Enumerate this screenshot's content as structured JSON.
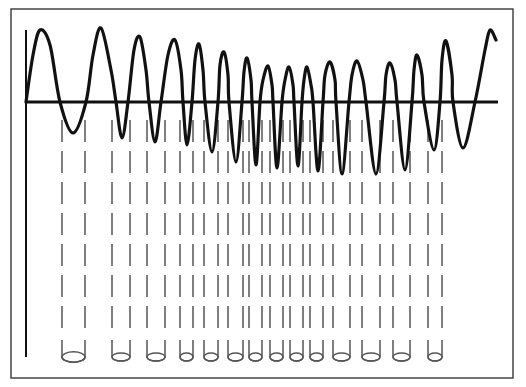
{
  "diagram": {
    "colors": {
      "stroke": "#111111",
      "dash": "#555555",
      "frame": "#444444",
      "background": "#ffffff"
    },
    "frame": {
      "x": 11,
      "y": 9,
      "w": 502,
      "h": 369
    },
    "y_axis": {
      "x": 26,
      "y1": 30,
      "y2": 357
    },
    "x_axis": {
      "y": 102,
      "x1": 26,
      "x2": 498
    },
    "wave_points": [
      [
        26,
        102
      ],
      [
        33,
        55
      ],
      [
        40,
        30
      ],
      [
        50,
        45
      ],
      [
        60,
        102
      ],
      [
        73,
        133
      ],
      [
        86,
        102
      ],
      [
        93,
        55
      ],
      [
        101,
        28
      ],
      [
        111,
        70
      ],
      [
        116,
        102
      ],
      [
        122,
        138
      ],
      [
        128,
        102
      ],
      [
        134,
        50
      ],
      [
        140,
        37
      ],
      [
        146,
        70
      ],
      [
        149,
        102
      ],
      [
        155,
        142
      ],
      [
        161,
        102
      ],
      [
        168,
        55
      ],
      [
        175,
        40
      ],
      [
        181,
        70
      ],
      [
        183,
        102
      ],
      [
        187,
        145
      ],
      [
        192,
        102
      ],
      [
        195,
        60
      ],
      [
        199,
        44
      ],
      [
        203,
        70
      ],
      [
        205,
        102
      ],
      [
        212,
        152
      ],
      [
        218,
        102
      ],
      [
        220,
        65
      ],
      [
        224,
        52
      ],
      [
        228,
        75
      ],
      [
        229,
        102
      ],
      [
        236,
        162
      ],
      [
        242,
        102
      ],
      [
        244,
        72
      ],
      [
        247,
        58
      ],
      [
        251,
        80
      ],
      [
        252,
        102
      ],
      [
        256,
        165
      ],
      [
        260,
        102
      ],
      [
        263,
        80
      ],
      [
        268,
        66
      ],
      [
        272,
        85
      ],
      [
        273,
        102
      ],
      [
        277,
        168
      ],
      [
        282,
        102
      ],
      [
        285,
        80
      ],
      [
        289,
        67
      ],
      [
        293,
        85
      ],
      [
        294,
        102
      ],
      [
        298,
        166
      ],
      [
        302,
        102
      ],
      [
        304,
        80
      ],
      [
        307,
        67
      ],
      [
        311,
        85
      ],
      [
        313,
        102
      ],
      [
        318,
        171
      ],
      [
        323,
        102
      ],
      [
        325,
        75
      ],
      [
        330,
        62
      ],
      [
        335,
        80
      ],
      [
        336,
        102
      ],
      [
        342,
        174
      ],
      [
        349,
        102
      ],
      [
        352,
        75
      ],
      [
        357,
        61
      ],
      [
        363,
        80
      ],
      [
        366,
        102
      ],
      [
        376,
        174
      ],
      [
        384,
        102
      ],
      [
        386,
        75
      ],
      [
        390,
        63
      ],
      [
        395,
        80
      ],
      [
        397,
        102
      ],
      [
        405,
        170
      ],
      [
        412,
        102
      ],
      [
        414,
        70
      ],
      [
        417,
        55
      ],
      [
        422,
        75
      ],
      [
        424,
        102
      ],
      [
        434,
        150
      ],
      [
        440,
        102
      ],
      [
        442,
        60
      ],
      [
        446,
        41
      ],
      [
        452,
        75
      ],
      [
        453,
        102
      ],
      [
        463,
        148
      ],
      [
        475,
        102
      ],
      [
        485,
        50
      ],
      [
        490,
        30
      ],
      [
        496,
        40
      ]
    ],
    "tubes": [
      {
        "x1": 62,
        "x2": 85
      },
      {
        "x1": 112,
        "x2": 130
      },
      {
        "x1": 147,
        "x2": 165
      },
      {
        "x1": 180,
        "x2": 193
      },
      {
        "x1": 204,
        "x2": 218
      },
      {
        "x1": 228,
        "x2": 243
      },
      {
        "x1": 249,
        "x2": 262
      },
      {
        "x1": 270,
        "x2": 283
      },
      {
        "x1": 290,
        "x2": 303
      },
      {
        "x1": 310,
        "x2": 323
      },
      {
        "x1": 333,
        "x2": 350
      },
      {
        "x1": 362,
        "x2": 380
      },
      {
        "x1": 393,
        "x2": 410
      },
      {
        "x1": 428,
        "x2": 442
      }
    ],
    "dash": {
      "y_start": 120,
      "y_tube_top": 340,
      "y_tube_bottom": 357,
      "dash_len": 22,
      "gap": 9
    }
  }
}
